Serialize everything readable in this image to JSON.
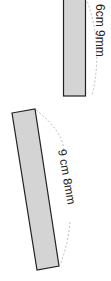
{
  "diagram": {
    "shapes": [
      {
        "id": "bar-1",
        "label": "6cm 9mm",
        "fill": "#d4d4d4",
        "stroke": "#222222"
      },
      {
        "id": "bar-2",
        "label": "9 cm 8mm",
        "fill": "#d4d4d4",
        "stroke": "#222222"
      }
    ]
  }
}
